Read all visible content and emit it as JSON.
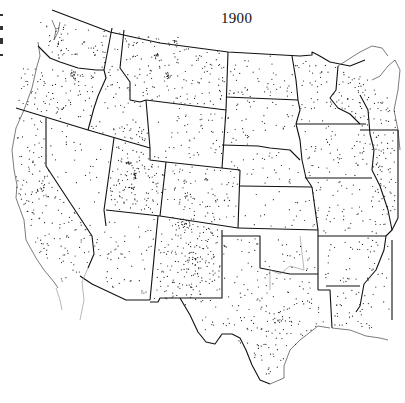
{
  "map": {
    "title": "1900",
    "subject": "Population distribution, western and central United States",
    "dot_color": "#222222",
    "boundary_color": "#111111",
    "background": "#ffffff"
  },
  "states": [
    {
      "name": "Washington",
      "dots": 55
    },
    {
      "name": "Oregon",
      "dots": 95
    },
    {
      "name": "California",
      "dots": 150
    },
    {
      "name": "Idaho",
      "dots": 60
    },
    {
      "name": "Nevada",
      "dots": 30
    },
    {
      "name": "Montana",
      "dots": 140
    },
    {
      "name": "Wyoming",
      "dots": 50
    },
    {
      "name": "Utah",
      "dots": 110
    },
    {
      "name": "Colorado",
      "dots": 80
    },
    {
      "name": "Arizona",
      "dots": 55
    },
    {
      "name": "New Mexico",
      "dots": 170
    },
    {
      "name": "North Dakota",
      "dots": 45
    },
    {
      "name": "South Dakota",
      "dots": 40
    },
    {
      "name": "Nebraska",
      "dots": 30
    },
    {
      "name": "Kansas",
      "dots": 22
    },
    {
      "name": "Oklahoma",
      "dots": 20
    },
    {
      "name": "Texas",
      "dots": 160
    },
    {
      "name": "Minnesota",
      "dots": 45
    },
    {
      "name": "Iowa",
      "dots": 55
    },
    {
      "name": "Missouri",
      "dots": 60
    },
    {
      "name": "Arkansas",
      "dots": 30
    },
    {
      "name": "Louisiana",
      "dots": 30
    },
    {
      "name": "Wisconsin",
      "dots": 70
    },
    {
      "name": "Illinois",
      "dots": 60
    },
    {
      "name": "Mississippi",
      "dots": 25
    }
  ]
}
